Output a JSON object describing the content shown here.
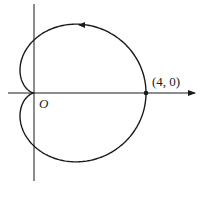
{
  "chart_data": {
    "type": "line",
    "title": "",
    "curve": "cardioid",
    "equation": "r = 2(1 + cos θ)",
    "origin_label": "O",
    "point_label": "(4, 0)",
    "marked_points": [
      {
        "x": 4,
        "y": 0,
        "label": "(4, 0)"
      }
    ],
    "direction": "counterclockwise",
    "xlabel": "",
    "ylabel": "",
    "grid": false
  },
  "labels": {
    "origin": "O",
    "point": "(4, 0)"
  },
  "colors": {
    "stroke": "#1a1a1a",
    "background": "#ffffff"
  }
}
